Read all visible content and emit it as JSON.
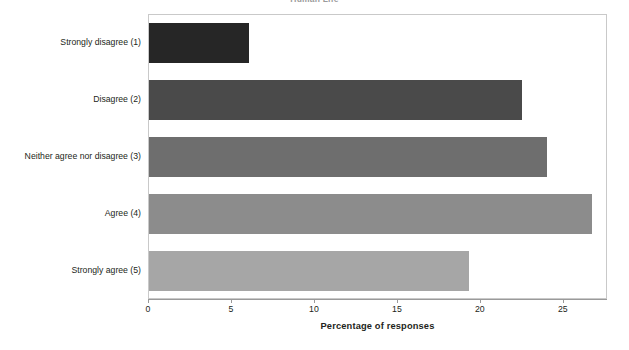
{
  "chart_data": {
    "type": "bar",
    "orientation": "horizontal",
    "title": "Human Life",
    "categories": [
      "Strongly disagree (1)",
      "Disagree (2)",
      "Neither agree nor disagree (3)",
      "Agree (4)",
      "Strongly agree (5)"
    ],
    "values": [
      6.0,
      22.5,
      24.0,
      26.7,
      19.3
    ],
    "bar_colors": [
      "#262626",
      "#4a4a4a",
      "#6e6e6e",
      "#8c8c8c",
      "#a6a6a6"
    ],
    "xlabel": "Percentage of responses",
    "ylabel": "",
    "xlim": [
      0,
      27.6
    ],
    "xticks": [
      0,
      5,
      10,
      15,
      20,
      25
    ],
    "xtick_labels": [
      "0",
      "5",
      "10",
      "15",
      "20",
      "25"
    ],
    "grid": false,
    "legend": "none",
    "frame": true,
    "frame_color": "#c9c9c9",
    "axis_color": "#9a9a9a",
    "text_color": "#231f20",
    "background": "#ffffff"
  }
}
